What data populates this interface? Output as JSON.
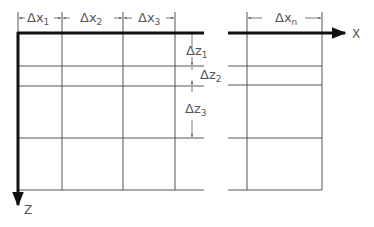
{
  "diagram": {
    "axes": {
      "x_label": "X",
      "z_label": "Z"
    },
    "dx_labels": [
      {
        "delta": "Δx",
        "sub": "1"
      },
      {
        "delta": "Δx",
        "sub": "2"
      },
      {
        "delta": "Δx",
        "sub": "3"
      },
      {
        "delta": "Δx",
        "sub": "n"
      }
    ],
    "dz_labels": [
      {
        "delta": "Δz",
        "sub": "1"
      },
      {
        "delta": "Δz",
        "sub": "2"
      },
      {
        "delta": "Δz",
        "sub": "3"
      }
    ],
    "colors": {
      "axis": "#111111",
      "grid": "#555555",
      "text": "#555555"
    }
  }
}
